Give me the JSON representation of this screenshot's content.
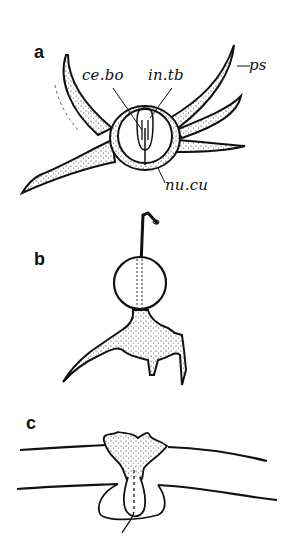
{
  "figure": {
    "panels": [
      {
        "letter": "a",
        "labels": {
          "ce_bo": "ce.bo",
          "in_tb": "in.tb",
          "ps": "ps",
          "nu_cu": "nu.cu"
        }
      },
      {
        "letter": "b"
      },
      {
        "letter": "c"
      }
    ],
    "colors": {
      "ink": "#111111",
      "background": "#ffffff"
    }
  }
}
